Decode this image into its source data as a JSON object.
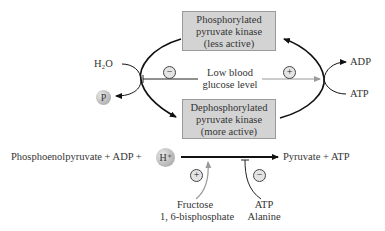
{
  "boxes": {
    "phosphorylated": {
      "line1": "Phosphorylated",
      "line2": "pyruvate kinase",
      "line3": "(less active)"
    },
    "dephosphorylated": {
      "line1": "Dephosphorylated",
      "line2": "pyruvate kinase",
      "line3": "(more active)"
    }
  },
  "left_cycle": {
    "input": "H₂O",
    "output": "P"
  },
  "right_cycle": {
    "input": "ATP",
    "output": "ADP"
  },
  "regulator_center": {
    "line1": "Low blood",
    "line2": "glucose level",
    "left_effect": "−",
    "right_effect": "+"
  },
  "reaction": {
    "substrates": "Phosphoenolpyruvate + ADP + ",
    "proton": "H⁺",
    "products": "Pyruvate + ATP"
  },
  "activator": {
    "sign": "+",
    "line1": "Fructose",
    "line2": "1, 6-bisphosphate"
  },
  "inhibitor": {
    "sign": "−",
    "line1": "ATP",
    "line2": "Alanine"
  },
  "colors": {
    "box_fill": "#d3d3d3",
    "arrow_dark": "#111111",
    "arrow_gray": "#9a9a9a"
  }
}
